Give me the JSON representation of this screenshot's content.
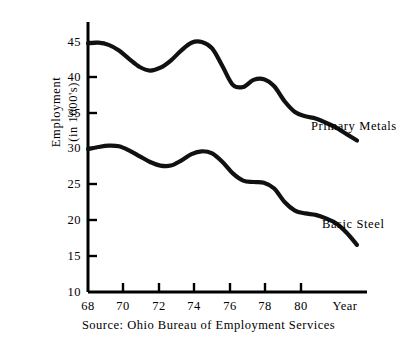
{
  "figure": {
    "source_note": "Source: Ohio Bureau of Employment Services",
    "axis_color": "#000000",
    "line_color": "#111111",
    "background": "#ffffff"
  },
  "axes": {
    "y_title_line1": "Employment",
    "y_title_line2": "(in 1000's)",
    "x_title": "Year",
    "y_ticks": [
      "45",
      "40",
      "35",
      "30",
      "25",
      "20",
      "15",
      "10"
    ],
    "x_ticks": [
      "68",
      "70",
      "72",
      "74",
      "76",
      "78",
      "80"
    ]
  },
  "labels": {
    "primary_metals": "Primary Metals",
    "basic_steel": "Basic Steel"
  },
  "chart_data": {
    "type": "line",
    "title": "",
    "subtitle": "",
    "xlabel": "Year",
    "ylabel": "Employment (in 1000's)",
    "xlim": [
      68,
      81
    ],
    "ylim": [
      10,
      45
    ],
    "y_tick_values": [
      45,
      40,
      35,
      30,
      25,
      20,
      15,
      10
    ],
    "x_tick_values": [
      68,
      70,
      72,
      74,
      76,
      78,
      80
    ],
    "grid": false,
    "legend_position": "inline-right-of-curve-end",
    "annotations": [
      "Primary Metals",
      "Basic Steel"
    ],
    "source": "Source: Ohio Bureau of Employment Services",
    "x": [
      68.0,
      68.5,
      69.0,
      69.5,
      70.0,
      70.5,
      71.0,
      71.5,
      72.0,
      72.5,
      73.0,
      73.5,
      74.0,
      74.5,
      75.0,
      75.5,
      76.0,
      76.5,
      77.0,
      77.5,
      78.0,
      78.5,
      79.0,
      79.5,
      80.0,
      80.5,
      81.0
    ],
    "series": [
      {
        "name": "Primary Metals",
        "values": [
          44.8,
          44.9,
          44.6,
          43.8,
          42.6,
          41.5,
          41.0,
          41.4,
          42.4,
          43.8,
          44.9,
          45.0,
          44.1,
          41.6,
          39.0,
          38.7,
          39.7,
          39.8,
          38.8,
          36.7,
          35.2,
          34.6,
          34.3,
          33.7,
          33.0,
          32.1,
          31.2
        ]
      },
      {
        "name": "Basic Steel",
        "values": [
          30.0,
          30.3,
          30.5,
          30.4,
          29.8,
          29.0,
          28.2,
          27.7,
          27.7,
          28.4,
          29.3,
          29.7,
          29.4,
          28.2,
          26.6,
          25.6,
          25.4,
          25.3,
          24.5,
          22.6,
          21.4,
          21.0,
          20.8,
          20.3,
          19.6,
          18.3,
          16.6
        ]
      }
    ]
  }
}
